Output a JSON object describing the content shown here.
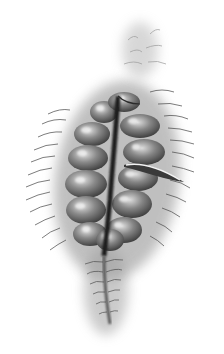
{
  "image": {
    "subject": "segmented bristle worm illustration",
    "style": "grayscale pencil/airbrush drawing",
    "background": "#ffffff",
    "colors": {
      "body_dark": "#2a2a2a",
      "body_mid": "#6b6b6b",
      "body_light": "#bdbdbd",
      "highlight": "#e8e8e8",
      "bristle": "#4a4a4a",
      "fuzz": "#9a9a9a"
    },
    "segments_left": 7,
    "segments_right": 7
  }
}
